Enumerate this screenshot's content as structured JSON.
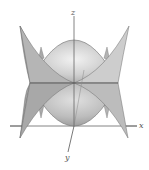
{
  "figure": {
    "type": "3d-surface-plot",
    "axes": {
      "x_label": "x",
      "y_label": "y",
      "z_label": "z"
    },
    "colors": {
      "surface_fill": "#bdbdbd",
      "surface_light": "#e6e6e6",
      "surface_dark": "#8f8f8f",
      "edge": "#6e6e6e",
      "axis": "#555555",
      "background": "#ffffff"
    }
  }
}
